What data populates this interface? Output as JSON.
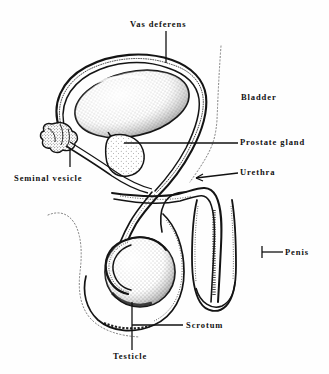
{
  "figure": {
    "background_color": "#fefefe",
    "ink_color": "#111111",
    "width": 329,
    "height": 374
  },
  "labels": {
    "vas_deferens": "Vas deferens",
    "bladder": "Bladder",
    "prostate_gland": "Prostate gland",
    "urethra": "Urethra",
    "seminal_vesicle": "Seminal vesicle",
    "penis": "Penis",
    "scrotum": "Scrotum",
    "testicle": "Testicle"
  },
  "structures": [
    {
      "name": "bladder",
      "label": "Bladder",
      "rendering": "stippled oval with double outline"
    },
    {
      "name": "vas-deferens",
      "label": "Vas deferens",
      "rendering": "looping double-line tube"
    },
    {
      "name": "prostate-gland",
      "label": "Prostate gland",
      "rendering": "stippled teardrop"
    },
    {
      "name": "seminal-vesicle",
      "label": "Seminal vesicle",
      "rendering": "lumpy cluster"
    },
    {
      "name": "urethra",
      "label": "Urethra",
      "rendering": "double-line channel"
    },
    {
      "name": "penis",
      "label": "Penis",
      "rendering": "elongated shaft with glans"
    },
    {
      "name": "scrotum",
      "label": "Scrotum",
      "rendering": "outline sac"
    },
    {
      "name": "testicle",
      "label": "Testicle",
      "rendering": "stippled sphere"
    }
  ]
}
